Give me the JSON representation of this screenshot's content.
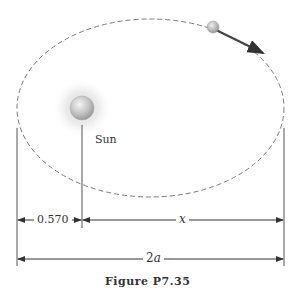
{
  "figure": {
    "caption": "Figure P7.35",
    "labels": {
      "sun": "Sun",
      "perihelion_distance": "0.570",
      "x": "x",
      "major_axis_number": "2",
      "major_axis_var": "a"
    },
    "colors": {
      "orbit": "#777777",
      "dimension_lines": "#333333",
      "sun_body": "#bdbdbd",
      "sun_glow": "#e6e6e6",
      "planet": "#b5b5b5",
      "velocity_arrow": "#444444"
    },
    "orbit": {
      "cx": 150.5,
      "cy": 108,
      "rx": 133.5,
      "ry": 89,
      "style": "dashed"
    },
    "sun": {
      "cx": 82,
      "cy": 108,
      "r": 12
    },
    "planet": {
      "cx": 213,
      "cy": 27,
      "r": 6
    }
  }
}
